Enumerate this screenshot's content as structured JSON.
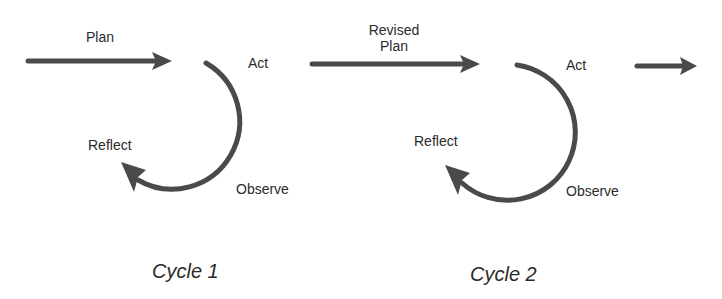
{
  "diagram": {
    "colors": {
      "stroke": "#4a4a4a",
      "text": "#2a2a2a",
      "background": "#ffffff"
    },
    "cycles": [
      {
        "caption": "Cycle 1",
        "input_label": "Plan",
        "steps": {
          "act": "Act",
          "observe": "Observe",
          "reflect": "Reflect"
        }
      },
      {
        "caption": "Cycle 2",
        "input_label_line1": "Revised",
        "input_label_line2": "Plan",
        "steps": {
          "act": "Act",
          "observe": "Observe",
          "reflect": "Reflect"
        }
      }
    ],
    "continuation_arrow": "right-arrow"
  }
}
